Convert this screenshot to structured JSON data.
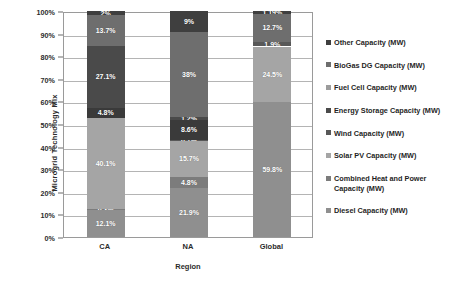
{
  "chart_data": {
    "type": "bar",
    "subtype": "stacked-percent",
    "title": "",
    "xlabel": "Region",
    "ylabel": "Microgrid Technology Mix",
    "categories": [
      "CA",
      "NA",
      "Global"
    ],
    "ylim": [
      0,
      100
    ],
    "ytick_labels": [
      "0%",
      "10%",
      "20%",
      "30%",
      "40%",
      "50%",
      "60%",
      "70%",
      "80%",
      "90%",
      "100%"
    ],
    "ytick_values": [
      0,
      10,
      20,
      30,
      40,
      50,
      60,
      70,
      80,
      90,
      100
    ],
    "grid": true,
    "legend_position": "right",
    "stack_order_bottom_to_top": [
      "Diesel Capacity (MW)",
      "Combined Heat and Power Capacity (MW)",
      "Solar PV Capacity (MW)",
      "Wind Capacity (MW)",
      "Energy Storage Capacity (MW)",
      "Fuel Cell Capacity (MW)",
      "BioGas DG Capacity (MW)",
      "Other Capacity (MW)"
    ],
    "series": [
      {
        "name": "Other Capacity (MW)",
        "color": "#3f3f3f",
        "values": [
          2,
          9,
          1.19
        ],
        "labels": [
          "2%",
          "9%",
          "1.19%"
        ]
      },
      {
        "name": "BioGas DG Capacity (MW)",
        "color": "#6e6e6e",
        "values": [
          13.7,
          38,
          12.7
        ],
        "labels": [
          "13.7%",
          "38%",
          "12.7%"
        ]
      },
      {
        "name": "Fuel Cell Capacity (MW)",
        "color": "#4a4a4a",
        "values": [
          27.1,
          1.2,
          0
        ],
        "labels": [
          "27.1%",
          "1.2%",
          ""
        ]
      },
      {
        "name": "Energy Storage Capacity (MW)",
        "color": "#3a3a3a",
        "values": [
          4.8,
          8.6,
          0
        ],
        "labels": [
          "4.8%",
          "8.6%",
          ""
        ]
      },
      {
        "name": "Wind Capacity (MW)",
        "color": "#585858",
        "values": [
          0,
          0.7,
          1.9
        ],
        "labels": [
          "",
          "0.7%",
          "1.9%"
        ]
      },
      {
        "name": "Solar PV Capacity (MW)",
        "color": "#a5a5a5",
        "values": [
          40.1,
          15.7,
          24.5
        ],
        "labels": [
          "40.1%",
          "15.7%",
          "24.5%"
        ]
      },
      {
        "name": "Combined Heat and Power Capacity (MW)",
        "color": "#7c7c7c",
        "values": [
          0.3,
          4.8,
          0
        ],
        "labels": [
          "0.3%",
          "4.8%",
          ""
        ]
      },
      {
        "name": "Diesel Capacity (MW)",
        "color": "#8f8f8f",
        "values": [
          12.1,
          21.9,
          59.8
        ],
        "labels": [
          "12.1%",
          "21.9%",
          "59.8%"
        ]
      }
    ]
  },
  "legend": {
    "items": [
      {
        "label": "Other Capacity (MW)",
        "color": "#3f3f3f"
      },
      {
        "label": "BioGas DG Capacity (MW)",
        "color": "#6e6e6e"
      },
      {
        "label": "Fuel Cell Capacity (MW)",
        "color": "#9c9c9c"
      },
      {
        "label": "Energy Storage Capacity (MW)",
        "color": "#4a4a4a"
      },
      {
        "label": "Wind Capacity (MW)",
        "color": "#585858"
      },
      {
        "label": "Solar PV Capacity (MW)",
        "color": "#a5a5a5"
      },
      {
        "label": "Combined Heat and Power Capacity (MW)",
        "color": "#7c7c7c"
      },
      {
        "label": "Diesel Capacity (MW)",
        "color": "#8f8f8f"
      }
    ]
  },
  "axes": {
    "x_title": "Region",
    "y_title": "Microgrid Technology Mix"
  }
}
